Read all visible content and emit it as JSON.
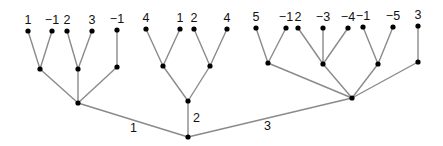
{
  "diagram": {
    "type": "tree",
    "colors": {
      "edge": "#8a8a8a",
      "node": "#000000",
      "text": "#111111"
    },
    "nodes": [
      {
        "id": "root",
        "x": 188,
        "y": 137
      },
      {
        "id": "A",
        "x": 78,
        "y": 103
      },
      {
        "id": "A1",
        "x": 40,
        "y": 69
      },
      {
        "id": "A2",
        "x": 78,
        "y": 69
      },
      {
        "id": "A3",
        "x": 117,
        "y": 67
      },
      {
        "id": "A1a",
        "x": 28,
        "y": 31,
        "label": "1"
      },
      {
        "id": "A1b",
        "x": 52,
        "y": 31,
        "label": "−1"
      },
      {
        "id": "A2a",
        "x": 67,
        "y": 31,
        "label": "2"
      },
      {
        "id": "A2b",
        "x": 92,
        "y": 31,
        "label": "3"
      },
      {
        "id": "A3a",
        "x": 117,
        "y": 30,
        "label": "−1"
      },
      {
        "id": "B",
        "x": 188,
        "y": 101
      },
      {
        "id": "B1",
        "x": 163,
        "y": 66
      },
      {
        "id": "B2",
        "x": 210,
        "y": 66
      },
      {
        "id": "B1a",
        "x": 146,
        "y": 29,
        "label": "4"
      },
      {
        "id": "B1b",
        "x": 180,
        "y": 29,
        "label": "1"
      },
      {
        "id": "B2a",
        "x": 194,
        "y": 29,
        "label": "2"
      },
      {
        "id": "B2b",
        "x": 227,
        "y": 29,
        "label": "4"
      },
      {
        "id": "C",
        "x": 352,
        "y": 98
      },
      {
        "id": "C1",
        "x": 268,
        "y": 63
      },
      {
        "id": "C2",
        "x": 323,
        "y": 64
      },
      {
        "id": "C3",
        "x": 378,
        "y": 64
      },
      {
        "id": "C4",
        "x": 418,
        "y": 62
      },
      {
        "id": "C1a",
        "x": 256,
        "y": 28,
        "label": "5"
      },
      {
        "id": "C1b",
        "x": 286,
        "y": 28,
        "label": "−1"
      },
      {
        "id": "C2a",
        "x": 298,
        "y": 28,
        "label": "2"
      },
      {
        "id": "C2b",
        "x": 323,
        "y": 28,
        "label": "−3"
      },
      {
        "id": "C2c",
        "x": 348,
        "y": 28,
        "label": "−4"
      },
      {
        "id": "C3a",
        "x": 363,
        "y": 27,
        "label": "−1"
      },
      {
        "id": "C3b",
        "x": 393,
        "y": 27,
        "label": "−5"
      },
      {
        "id": "C4a",
        "x": 418,
        "y": 26,
        "label": "3"
      }
    ],
    "edges": [
      {
        "from": "root",
        "to": "A",
        "label": "1",
        "lx": 130,
        "ly": 132
      },
      {
        "from": "root",
        "to": "B",
        "label": "2",
        "lx": 193,
        "ly": 122
      },
      {
        "from": "root",
        "to": "C",
        "label": "3",
        "lx": 264,
        "ly": 130
      },
      {
        "from": "A",
        "to": "A1"
      },
      {
        "from": "A",
        "to": "A2"
      },
      {
        "from": "A",
        "to": "A3"
      },
      {
        "from": "A1",
        "to": "A1a"
      },
      {
        "from": "A1",
        "to": "A1b"
      },
      {
        "from": "A2",
        "to": "A2a"
      },
      {
        "from": "A2",
        "to": "A2b"
      },
      {
        "from": "A3",
        "to": "A3a"
      },
      {
        "from": "B",
        "to": "B1"
      },
      {
        "from": "B",
        "to": "B2"
      },
      {
        "from": "B1",
        "to": "B1a"
      },
      {
        "from": "B1",
        "to": "B1b"
      },
      {
        "from": "B2",
        "to": "B2a"
      },
      {
        "from": "B2",
        "to": "B2b"
      },
      {
        "from": "C",
        "to": "C1"
      },
      {
        "from": "C",
        "to": "C2"
      },
      {
        "from": "C",
        "to": "C3"
      },
      {
        "from": "C",
        "to": "C4"
      },
      {
        "from": "C1",
        "to": "C1a"
      },
      {
        "from": "C1",
        "to": "C1b"
      },
      {
        "from": "C2",
        "to": "C2a"
      },
      {
        "from": "C2",
        "to": "C2b"
      },
      {
        "from": "C2",
        "to": "C2c"
      },
      {
        "from": "C3",
        "to": "C3a"
      },
      {
        "from": "C3",
        "to": "C3b"
      },
      {
        "from": "C4",
        "to": "C4a"
      }
    ]
  }
}
